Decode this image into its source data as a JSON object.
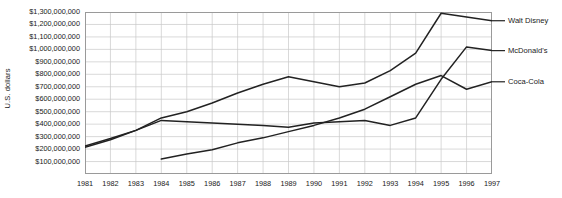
{
  "chart_data": {
    "type": "line",
    "title": "",
    "xlabel": "",
    "ylabel": "U.S. dollars",
    "x": [
      1981,
      1982,
      1983,
      1984,
      1985,
      1986,
      1987,
      1988,
      1989,
      1990,
      1991,
      1992,
      1993,
      1994,
      1995,
      1996,
      1997
    ],
    "categories": [
      "1981",
      "1982",
      "1983",
      "1984",
      "1985",
      "1986",
      "1987",
      "1988",
      "1989",
      "1990",
      "1991",
      "1992",
      "1993",
      "1994",
      "1995",
      "1996",
      "1997"
    ],
    "xlim": [
      1981,
      1997
    ],
    "ylim": [
      0,
      1300000000
    ],
    "y_ticks": [
      100000000,
      200000000,
      300000000,
      400000000,
      500000000,
      600000000,
      700000000,
      800000000,
      900000000,
      1000000000,
      1100000000,
      1200000000,
      1300000000
    ],
    "y_tick_labels": [
      "$1,300,000,000",
      "$1,200,000,000",
      "$1,100,000,000",
      "$1,000,000,000",
      "$900,000,000",
      "$800,000,000",
      "$700,000,000",
      "$600,000,000",
      "$500,000,000",
      "$400,000,000",
      "$300,000,000",
      "$200,000,000",
      "$100,000,000"
    ],
    "grid": true,
    "legend_position": "right-inline",
    "series": [
      {
        "name": "Walt Disney",
        "color": "#222222",
        "x": [
          1981,
          1982,
          1983,
          1984,
          1985,
          1986,
          1987,
          1988,
          1989,
          1990,
          1991,
          1992,
          1993,
          1994,
          1995,
          1996,
          1997
        ],
        "values": [
          215000000,
          275000000,
          350000000,
          450000000,
          500000000,
          570000000,
          650000000,
          720000000,
          780000000,
          740000000,
          700000000,
          730000000,
          830000000,
          970000000,
          1290000000,
          1260000000,
          1230000000
        ]
      },
      {
        "name": "McDonald's",
        "color": "#222222",
        "x": [
          1981,
          1982,
          1983,
          1984,
          1985,
          1986,
          1987,
          1988,
          1989,
          1990,
          1991,
          1992,
          1993,
          1994,
          1995,
          1996,
          1997
        ],
        "values": [
          225000000,
          285000000,
          350000000,
          430000000,
          420000000,
          410000000,
          400000000,
          390000000,
          375000000,
          410000000,
          420000000,
          430000000,
          390000000,
          450000000,
          760000000,
          1020000000,
          990000000
        ]
      },
      {
        "name": "Coca-Cola",
        "color": "#222222",
        "x": [
          1984,
          1985,
          1986,
          1987,
          1988,
          1989,
          1990,
          1991,
          1992,
          1993,
          1994,
          1995,
          1996,
          1997
        ],
        "values": [
          120000000,
          160000000,
          195000000,
          250000000,
          290000000,
          340000000,
          390000000,
          450000000,
          520000000,
          620000000,
          720000000,
          790000000,
          680000000,
          740000000
        ]
      }
    ]
  }
}
